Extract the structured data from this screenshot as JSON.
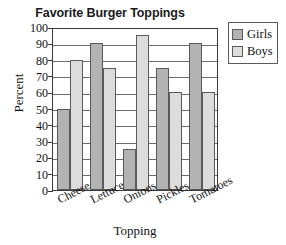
{
  "chart_data": {
    "type": "bar",
    "title": "Favorite Burger Toppings",
    "xlabel": "Topping",
    "ylabel": "Percent",
    "categories": [
      "Cheese",
      "Lettuce",
      "Onions",
      "Pickles",
      "Tomatoes"
    ],
    "series": [
      {
        "name": "Girls",
        "values": [
          50,
          90,
          25,
          75,
          90
        ],
        "color": "#b3b3b3"
      },
      {
        "name": "Boys",
        "values": [
          80,
          75,
          95,
          60,
          60
        ],
        "color": "#dcdcdc"
      }
    ],
    "ylim": [
      0,
      100
    ],
    "ytick_labels": [
      "100",
      "90",
      "80",
      "70",
      "60",
      "50",
      "40",
      "30",
      "20",
      "10",
      "0"
    ],
    "ytick_values": [
      100,
      90,
      80,
      70,
      60,
      50,
      40,
      30,
      20,
      10,
      0
    ],
    "ytick_step": 10,
    "grid": true,
    "grid_axis": "y",
    "legend_position": "top-right",
    "legend_entries": [
      "Girls",
      "Boys"
    ],
    "bar_orientation": "vertical",
    "bar_border_color": "#5a5a5a",
    "frame_color": "#3a3a3a",
    "xtick_label_rotation_deg": -27
  }
}
